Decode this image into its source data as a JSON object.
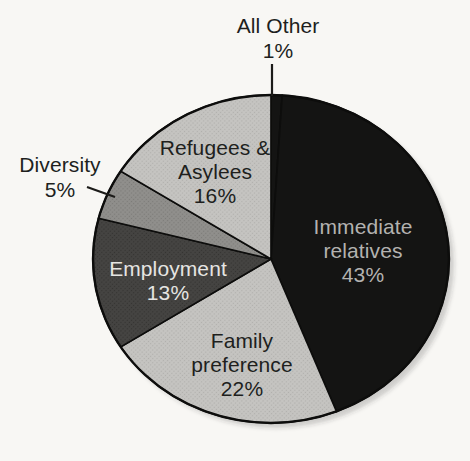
{
  "figure": {
    "background_color": "#f8f7f4",
    "outline_color": "#0d0d0c"
  },
  "chart_data": {
    "type": "pie",
    "title": "",
    "start_angle_deg": 0,
    "direction": "clockwise",
    "units": "%",
    "segments": [
      {
        "label": "All Other",
        "value": 1,
        "pct": "1%",
        "color": "#141413",
        "texture": "solid",
        "text_color": "#201f1d",
        "label_placement": "outside-top",
        "leader_line": true
      },
      {
        "label": "Immediate relatives",
        "value": 43,
        "pct": "43%",
        "color": "#141413",
        "texture": "solid",
        "text_color": "#b3b2b0",
        "label_placement": "inside",
        "leader_line": false
      },
      {
        "label": "Family preference",
        "value": 22,
        "pct": "22%",
        "color": "#c5c4c1",
        "texture": "halftone-light",
        "text_color": "#201f1d",
        "label_placement": "inside",
        "leader_line": false
      },
      {
        "label": "Employment",
        "value": 13,
        "pct": "13%",
        "color": "#454442",
        "texture": "halftone-dark",
        "text_color": "#e6e5e2",
        "label_placement": "inside",
        "leader_line": false
      },
      {
        "label": "Diversity",
        "value": 5,
        "pct": "5%",
        "color": "#908f8c",
        "texture": "halftone-mid",
        "text_color": "#201f1d",
        "label_placement": "outside-left",
        "leader_line": true
      },
      {
        "label": "Refugees & Asylees",
        "value": 16,
        "pct": "16%",
        "color": "#c5c4c1",
        "texture": "halftone-light",
        "text_color": "#201f1d",
        "label_placement": "inside",
        "leader_line": false
      }
    ]
  }
}
